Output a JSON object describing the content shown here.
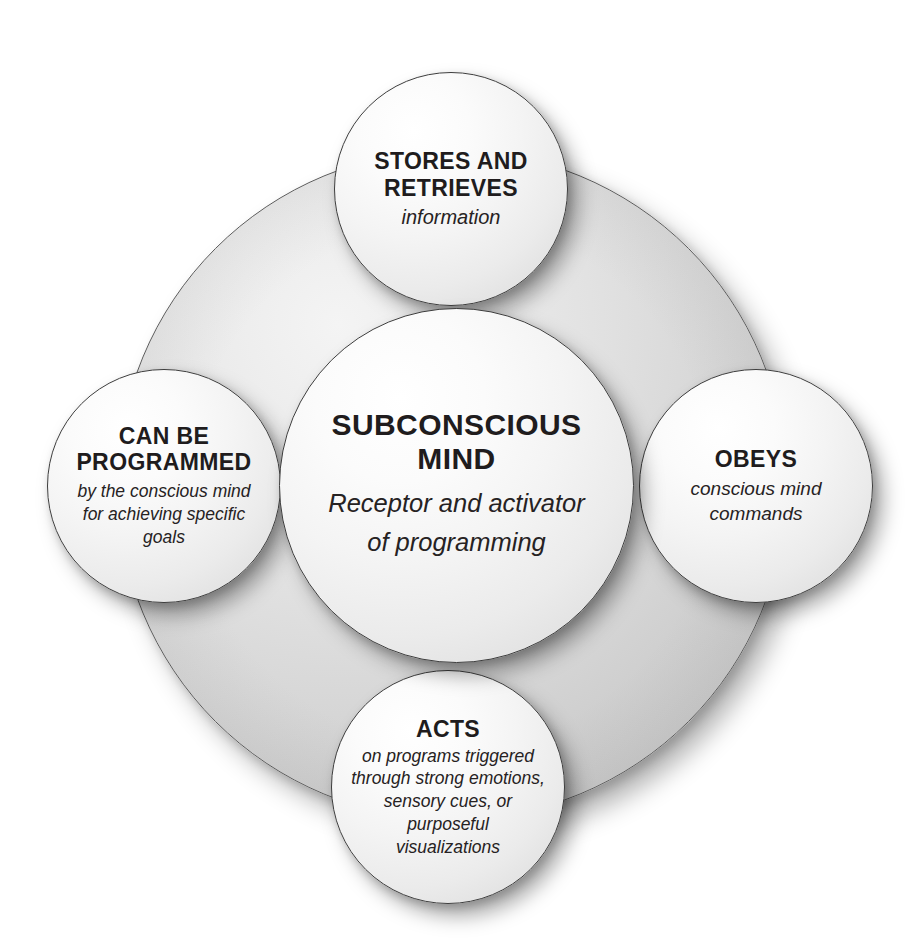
{
  "diagram": {
    "kind": "venn-style concentric circle diagram",
    "background_disc": {
      "name": "outer-shaded-disc",
      "fill_hex": "#d8d8d8",
      "stroke_hex": "#5b5b5b"
    },
    "palette": {
      "page_background": "#ffffff",
      "node_fill": "#f4f4f4",
      "node_stroke": "#3d3d3d",
      "text": "#231f20"
    },
    "nodes": [
      {
        "id": "center",
        "title_lines": [
          "SUBCONSCIOUS",
          "MIND"
        ],
        "sub_lines": [
          "Receptor and activator",
          "of programming"
        ]
      },
      {
        "id": "top",
        "title_lines": [
          "STORES AND",
          "RETRIEVES"
        ],
        "sub_lines": [
          "information"
        ]
      },
      {
        "id": "left",
        "title_lines": [
          "CAN BE",
          "PROGRAMMED"
        ],
        "sub_lines": [
          "by the conscious mind",
          "for achieving specific",
          "goals"
        ]
      },
      {
        "id": "right",
        "title_lines": [
          "OBEYS"
        ],
        "sub_lines": [
          "conscious mind",
          "commands"
        ]
      },
      {
        "id": "bottom",
        "title_lines": [
          "ACTS"
        ],
        "sub_lines": [
          "on programs triggered",
          "through strong emotions,",
          "sensory cues, or",
          "purposeful",
          "visualizations"
        ]
      }
    ]
  }
}
